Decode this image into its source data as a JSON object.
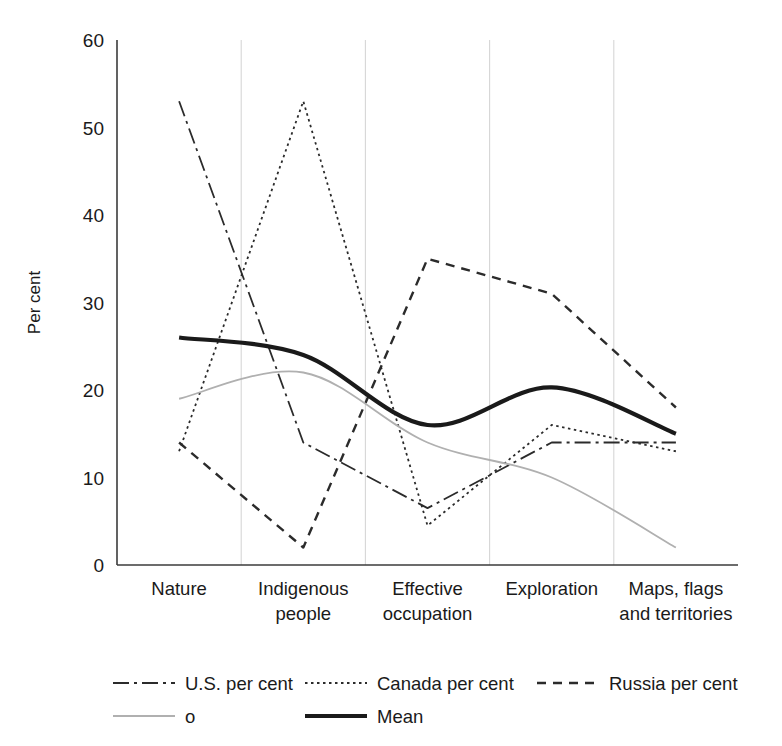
{
  "chart_data": {
    "type": "line",
    "title": "",
    "xlabel": "",
    "ylabel": "Per cent",
    "ylim": [
      0,
      60
    ],
    "yticks": [
      0,
      10,
      20,
      30,
      40,
      50,
      60
    ],
    "grid": "vertical",
    "legend_position": "bottom",
    "categories": [
      "Nature",
      "Indigenous people",
      "Effective occupation",
      "Exploration",
      "Maps, flags and territories"
    ],
    "category_lines": [
      [
        "Nature"
      ],
      [
        "Indigenous",
        "people"
      ],
      [
        "Effective",
        "occupation"
      ],
      [
        "Exploration"
      ],
      [
        "Maps, flags",
        "and territories"
      ]
    ],
    "series": [
      {
        "name": "U.S. per cent",
        "style": "dash-dot",
        "color": "#2b2b2b",
        "width": 1.8,
        "dasharray": "16 5 3 5",
        "smooth": false,
        "values": [
          53,
          14,
          6.5,
          14,
          14
        ]
      },
      {
        "name": "Canada per cent",
        "style": "dotted",
        "color": "#2b2b2b",
        "width": 1.8,
        "dasharray": "2.5 3.5",
        "smooth": false,
        "values": [
          13,
          53,
          4.5,
          16,
          13
        ]
      },
      {
        "name": "Russia per cent",
        "style": "dashed",
        "color": "#2b2b2b",
        "width": 2.4,
        "dasharray": "9 7",
        "smooth": false,
        "values": [
          14,
          2,
          35,
          31,
          18
        ]
      },
      {
        "name": "o",
        "style": "solid-light",
        "color": "#b0b0b0",
        "width": 1.8,
        "dasharray": "",
        "smooth": true,
        "values": [
          19,
          22,
          14,
          10,
          2
        ]
      },
      {
        "name": "Mean",
        "style": "solid-bold",
        "color": "#1a1a1a",
        "width": 4.2,
        "dasharray": "",
        "smooth": true,
        "values": [
          26,
          24,
          16,
          20.3,
          15
        ]
      }
    ]
  },
  "legend": {
    "entries": [
      {
        "label": "U.S. per cent"
      },
      {
        "label": "Canada per cent"
      },
      {
        "label": "Russia per cent"
      },
      {
        "label": "o"
      },
      {
        "label": "Mean"
      }
    ]
  },
  "axis": {
    "y_title": "Per cent",
    "y_tick_labels": [
      "0",
      "10",
      "20",
      "30",
      "40",
      "50",
      "60"
    ]
  }
}
